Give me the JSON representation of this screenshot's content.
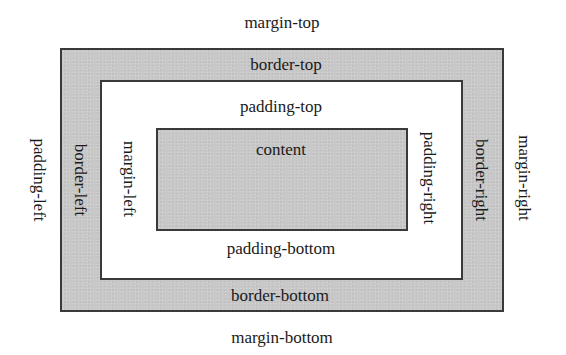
{
  "diagram": {
    "colors": {
      "border_fill": "#c8c8c8",
      "content_fill": "#c8c8c8",
      "padding_fill": "#ffffff",
      "outline": "#3a3a3a",
      "text": "#1a1a1a"
    },
    "labels": {
      "margin_top": "margin-top",
      "margin_bottom": "margin-bottom",
      "margin_left": "padding-left",
      "margin_right": "margin-right",
      "border_top": "border-top",
      "border_bottom": "border-bottom",
      "border_left": "border-left",
      "border_right": "border-right",
      "padding_top": "padding-top",
      "padding_bottom": "padding-bottom",
      "padding_left": "margin-left",
      "padding_right": "padding-right",
      "content": "content"
    }
  }
}
